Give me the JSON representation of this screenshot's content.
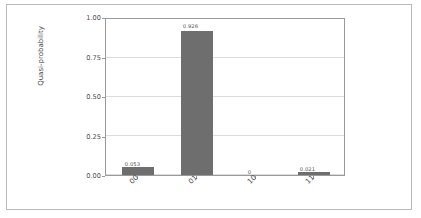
{
  "chart_data": {
    "type": "bar",
    "title": "",
    "xlabel": "",
    "ylabel": "Quasi-probability",
    "categories": [
      "00",
      "01",
      "10",
      "11"
    ],
    "values": [
      0.053,
      0.926,
      0,
      0.021
    ],
    "value_labels": [
      "0.053",
      "0.926",
      "0",
      "0.021"
    ],
    "ylim": [
      0.0,
      1.0
    ],
    "ytick_labels": [
      "0.00",
      "0.25",
      "0.50",
      "0.75",
      "1.00"
    ],
    "ytick_values": [
      0.0,
      0.25,
      0.5,
      0.75,
      1.0
    ],
    "grid": true,
    "legend": "none",
    "bar_color": "#6e6e6e",
    "xtick_rotation": -45
  }
}
